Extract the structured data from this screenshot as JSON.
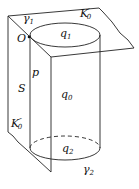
{
  "labels": {
    "gamma1": "γ",
    "gamma1_sub": "1",
    "K0p": "K",
    "K0p_sup": "′",
    "K0p_sub": "0",
    "O": "O",
    "q1": "q",
    "q1_sub": "1",
    "p": "p",
    "S": "S",
    "q0": "q",
    "q0_sub": "0",
    "K0pp": "K",
    "K0pp_sup": "″",
    "K0pp_sub": "0",
    "q2": "q",
    "q2_sub": "2",
    "gamma2": "γ",
    "gamma2_sub": "2"
  }
}
